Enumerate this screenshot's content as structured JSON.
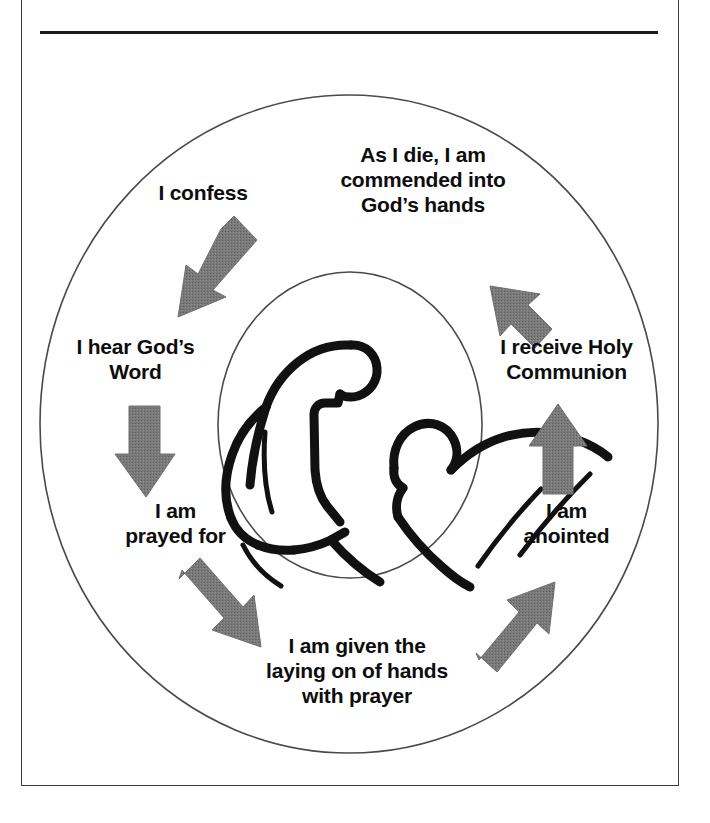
{
  "figure": {
    "colors": {
      "frame": "#3a3a3a",
      "rule": "#1c1c1c",
      "circle_outline": "#4a4a4a",
      "arrow": "#6f6f6f",
      "text": "#0d0d0d",
      "artwork": "#111111",
      "background": "#ffffff"
    },
    "center_illustration": {
      "name": "person-caring-for-reclining-person-line-art",
      "description": "Line drawing of a kneeling figure leaning over a reclining figure"
    },
    "rings": {
      "outer_circle": "outer-cycle-circle",
      "inner_circle": "inner-illustration-circle"
    }
  },
  "cycle": {
    "steps": [
      {
        "id": "confess",
        "label": "I confess"
      },
      {
        "id": "hear-word",
        "label": "I hear God’s\nWord"
      },
      {
        "id": "prayed-for",
        "label": "I am\nprayed for"
      },
      {
        "id": "laying-hands",
        "label": "I am given the\nlaying on of hands\nwith prayer"
      },
      {
        "id": "anointed",
        "label": "I am\nanointed"
      },
      {
        "id": "communion",
        "label": "I receive Holy\nCommunion"
      },
      {
        "id": "commended",
        "label": "As I die, I am\ncommended into\nGod’s hands"
      }
    ],
    "arrows": [
      {
        "id": "arrow-confess-to-hear-word",
        "direction": "down-left",
        "from": "confess",
        "to": "hear-word"
      },
      {
        "id": "arrow-hear-word-to-prayed-for",
        "direction": "down",
        "from": "hear-word",
        "to": "prayed-for"
      },
      {
        "id": "arrow-prayed-for-to-laying-hands",
        "direction": "down-right",
        "from": "prayed-for",
        "to": "laying-hands"
      },
      {
        "id": "arrow-laying-hands-to-anointed",
        "direction": "up-right",
        "from": "laying-hands",
        "to": "anointed"
      },
      {
        "id": "arrow-anointed-to-communion",
        "direction": "up",
        "from": "anointed",
        "to": "communion"
      },
      {
        "id": "arrow-communion-to-commended",
        "direction": "up-left",
        "from": "communion",
        "to": "commended"
      }
    ]
  }
}
